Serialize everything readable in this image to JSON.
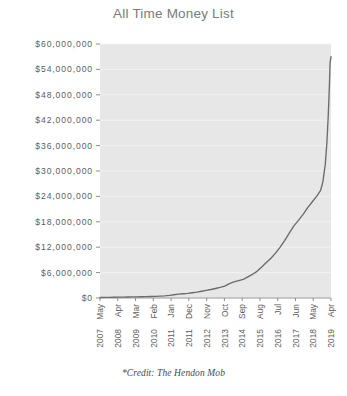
{
  "chart_data": {
    "type": "line",
    "title": "All Time Money List",
    "caption": "*Credit: The Hendon Mob",
    "xlabel": "",
    "ylabel": "",
    "grid": true,
    "legend": null,
    "ylim": [
      0,
      60000000
    ],
    "ytick_values": [
      0,
      6000000,
      12000000,
      18000000,
      24000000,
      30000000,
      36000000,
      42000000,
      48000000,
      54000000,
      60000000
    ],
    "ytick_labels": [
      "$0",
      "$6,000,000",
      "$12,000,000",
      "$18,000,000",
      "$24,000,000",
      "$30,000,000",
      "$36,000,000",
      "$42,000,000",
      "$48,000,000",
      "$54,000,000",
      "$60,000,000"
    ],
    "xtick_labels": [
      {
        "month": "May",
        "year": "2007"
      },
      {
        "month": "Apr",
        "year": "2008"
      },
      {
        "month": "Mar",
        "year": "2009"
      },
      {
        "month": "Feb",
        "year": "2010"
      },
      {
        "month": "Jan",
        "year": "2011"
      },
      {
        "month": "Dec",
        "year": "2011"
      },
      {
        "month": "Nov",
        "year": "2012"
      },
      {
        "month": "Oct",
        "year": "2013"
      },
      {
        "month": "Sep",
        "year": "2014"
      },
      {
        "month": "Aug",
        "year": "2015"
      },
      {
        "month": "Jul",
        "year": "2016"
      },
      {
        "month": "Jun",
        "year": "2017"
      },
      {
        "month": "May",
        "year": "2018"
      },
      {
        "month": "Apr",
        "year": "2019"
      }
    ],
    "x": [
      0,
      0.02,
      0.04,
      0.06,
      0.08,
      0.1,
      0.12,
      0.14,
      0.16,
      0.18,
      0.2,
      0.22,
      0.24,
      0.26,
      0.28,
      0.3,
      0.32,
      0.34,
      0.36,
      0.38,
      0.4,
      0.42,
      0.44,
      0.46,
      0.48,
      0.5,
      0.52,
      0.54,
      0.56,
      0.58,
      0.6,
      0.62,
      0.64,
      0.66,
      0.68,
      0.7,
      0.72,
      0.74,
      0.76,
      0.78,
      0.8,
      0.82,
      0.84,
      0.86,
      0.88,
      0.9,
      0.92,
      0.94,
      0.955,
      0.965,
      0.975,
      0.982,
      0.988,
      0.993,
      0.996,
      1.0
    ],
    "values": [
      120000,
      140000,
      160000,
      180000,
      200000,
      220000,
      240000,
      260000,
      280000,
      300000,
      330000,
      360000,
      400000,
      450000,
      520000,
      620000,
      760000,
      900000,
      1000000,
      1100000,
      1250000,
      1400000,
      1600000,
      1800000,
      2000000,
      2250000,
      2500000,
      2800000,
      3400000,
      3800000,
      4100000,
      4400000,
      5000000,
      5600000,
      6300000,
      7300000,
      8400000,
      9400000,
      10600000,
      12000000,
      13600000,
      15400000,
      17100000,
      18400000,
      19800000,
      21400000,
      22800000,
      24200000,
      25400000,
      27500000,
      31500000,
      36500000,
      43000000,
      50000000,
      55500000,
      57000000
    ],
    "series_name": "All Time Money List",
    "line_color": "#6b6b6b",
    "plot_bg_color": "#e7e7e7",
    "grid_color": "#f2f2f2",
    "text_color": "#5d5d5d",
    "title_color": "#7b7b7b"
  },
  "geometry": {
    "plot_left": 100,
    "plot_right": 331,
    "plot_top": 44,
    "plot_bottom": 298
  }
}
